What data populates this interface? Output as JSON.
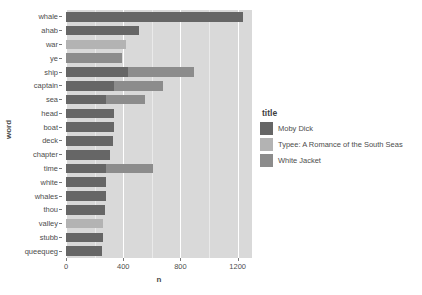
{
  "chart_data": {
    "type": "bar",
    "subtype": "stacked-horizontal",
    "title": "",
    "xlabel": "n",
    "ylabel": "word",
    "xlim": [
      0,
      1300
    ],
    "xticks": [
      0,
      400,
      800,
      1200
    ],
    "xtick_labels": [
      "0",
      "400",
      "800",
      "1200"
    ],
    "grid": true,
    "grid_color": "#ffffff",
    "panel_background": "#d9d9d9",
    "legend": {
      "title": "title",
      "position": "right",
      "entries": [
        {
          "label": "Moby Dick",
          "color": "#666666"
        },
        {
          "label": "Typee: A Romance of the South Seas",
          "color": "#b3b3b3"
        },
        {
          "label": "White Jacket",
          "color": "#8c8c8c"
        }
      ]
    },
    "categories": [
      "whale",
      "ahab",
      "war",
      "ye",
      "ship",
      "captain",
      "sea",
      "head",
      "boat",
      "deck",
      "chapter",
      "time",
      "white",
      "whales",
      "thou",
      "valley",
      "stubb",
      "queequeg"
    ],
    "series": [
      {
        "name": "Moby Dick",
        "color": "#666666",
        "values": [
          1235,
          511,
          0,
          0,
          436,
          336,
          279,
          337,
          336,
          330,
          309,
          283,
          280,
          277,
          271,
          0,
          257,
          252
        ]
      },
      {
        "name": "Typee: A Romance of the South Seas",
        "color": "#b3b3b3",
        "values": [
          0,
          0,
          420,
          0,
          0,
          0,
          0,
          0,
          0,
          0,
          0,
          0,
          0,
          0,
          0,
          260,
          0,
          0
        ]
      },
      {
        "name": "White Jacket",
        "color": "#8c8c8c",
        "values": [
          0,
          0,
          0,
          393,
          461,
          344,
          275,
          0,
          0,
          0,
          0,
          328,
          0,
          0,
          0,
          0,
          0,
          0
        ]
      }
    ],
    "totals": [
      1235,
      511,
      420,
      393,
      897,
      680,
      554,
      337,
      336,
      330,
      309,
      611,
      280,
      277,
      271,
      260,
      257,
      252
    ]
  }
}
